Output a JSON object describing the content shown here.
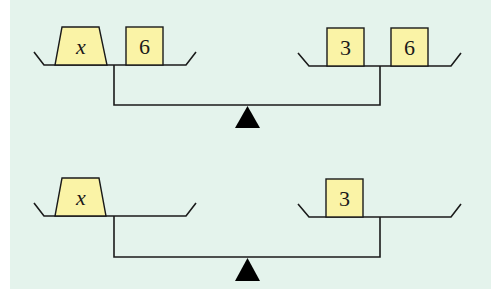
{
  "colors": {
    "background": "#e4f3ec",
    "block_fill": "#faf3a6",
    "stroke": "#1a1a1a",
    "fulcrum": "#000000"
  },
  "scales": [
    {
      "id": "top",
      "left_pan": {
        "blocks": [
          {
            "label": "x",
            "kind": "variable"
          },
          {
            "label": "6",
            "kind": "number"
          }
        ]
      },
      "right_pan": {
        "blocks": [
          {
            "label": "3",
            "kind": "number"
          },
          {
            "label": "6",
            "kind": "number"
          }
        ]
      }
    },
    {
      "id": "bottom",
      "left_pan": {
        "blocks": [
          {
            "label": "x",
            "kind": "variable"
          }
        ]
      },
      "right_pan": {
        "blocks": [
          {
            "label": "3",
            "kind": "number"
          }
        ]
      }
    }
  ]
}
